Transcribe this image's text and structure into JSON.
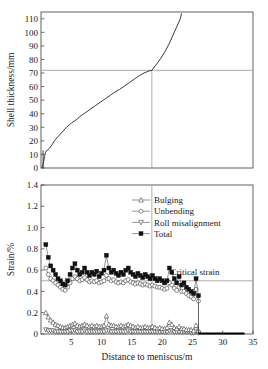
{
  "figure": {
    "top_panel": {
      "ylabel": "Shell thickness/mm",
      "yticks": [
        0,
        10,
        20,
        30,
        40,
        50,
        60,
        70,
        80,
        90,
        100,
        110
      ],
      "ylim": [
        0,
        115
      ],
      "xlim": [
        0,
        35
      ],
      "reference_lines": {
        "horizontal_value": 72,
        "vertical_value": 18.3
      }
    },
    "bottom_panel": {
      "ylabel": "Strain/%",
      "xlabel": "Distance to meniscus/m",
      "yticks": [
        "0",
        "0.2",
        "0.4",
        "0.6",
        "0.8",
        "1.0",
        "1.2",
        "1.4"
      ],
      "ytick_values": [
        0,
        0.2,
        0.4,
        0.6,
        0.8,
        1.0,
        1.2,
        1.4
      ],
      "xticks": [
        5,
        10,
        15,
        20,
        25,
        30,
        35
      ],
      "ylim": [
        0,
        1.4
      ],
      "xlim": [
        0,
        35
      ],
      "annotation": "Critical strain",
      "critical_strain_value": 0.5,
      "vertical_reference_value": 18.3
    },
    "legend": {
      "items": [
        {
          "label": "Bulging",
          "marker": "triangle-up-open"
        },
        {
          "label": "Unbending",
          "marker": "circle-open"
        },
        {
          "label": "Roll misalignment",
          "marker": "triangle-down-open"
        },
        {
          "label": "Total",
          "marker": "square-filled"
        }
      ]
    }
  },
  "chart_data": [
    {
      "type": "line",
      "panel": "top",
      "title": "",
      "xlabel": "Distance to meniscus/m",
      "ylabel": "Shell thickness/mm",
      "xlim": [
        0,
        35
      ],
      "ylim": [
        0,
        115
      ],
      "grid": false,
      "legend_position": "none",
      "annotations": [
        {
          "type": "hline",
          "y": 72
        },
        {
          "type": "vline",
          "x": 18.3
        }
      ],
      "series": [
        {
          "name": "Shell thickness",
          "x": [
            0.15,
            0.3,
            0.45,
            0.6,
            0.75,
            0.9,
            1.1,
            1.4,
            1.8,
            2.3,
            2.9,
            3.5,
            4.2,
            5.0,
            5.8,
            6.6,
            7.4,
            8.2,
            9.0,
            9.8,
            10.6,
            11.4,
            12.2,
            13.0,
            13.8,
            14.6,
            15.4,
            16.2,
            17.0,
            17.8,
            18.3,
            19.0,
            19.8,
            20.5,
            21.2,
            21.8,
            22.3,
            22.7,
            23.0,
            23.2
          ],
          "values": [
            0.5,
            2.0,
            5.0,
            8.5,
            11.5,
            12.8,
            13.2,
            14.5,
            17.0,
            20.5,
            23.5,
            26.5,
            30.0,
            33.0,
            35.5,
            38.5,
            41.0,
            43.5,
            46.0,
            48.5,
            51.0,
            53.5,
            56.0,
            58.0,
            60.5,
            63.0,
            65.5,
            68.0,
            70.0,
            71.5,
            72.0,
            76.0,
            81.0,
            86.0,
            92.0,
            98.0,
            103.0,
            107.0,
            110.0,
            114.0
          ]
        }
      ]
    },
    {
      "type": "scatter",
      "panel": "bottom",
      "title": "",
      "xlabel": "Distance to meniscus/m",
      "ylabel": "Strain/%",
      "xlim": [
        0,
        35
      ],
      "ylim": [
        0,
        1.4
      ],
      "grid": false,
      "legend_position": "upper-center",
      "annotations": [
        {
          "type": "hline",
          "y": 0.5,
          "label": "Critical strain"
        },
        {
          "type": "vline",
          "x": 18.3
        }
      ],
      "x": [
        0.8,
        1.2,
        1.6,
        2.0,
        2.4,
        2.8,
        3.2,
        3.6,
        4.0,
        4.4,
        4.8,
        5.2,
        5.6,
        6.0,
        6.4,
        6.8,
        7.2,
        7.6,
        8.0,
        8.4,
        8.8,
        9.2,
        9.6,
        10.0,
        10.4,
        10.8,
        11.2,
        11.6,
        12.0,
        12.4,
        12.8,
        13.2,
        13.6,
        14.0,
        14.4,
        14.8,
        15.2,
        15.6,
        16.0,
        16.4,
        16.8,
        17.2,
        17.6,
        18.0,
        18.4,
        18.8,
        19.2,
        19.6,
        20.0,
        20.4,
        20.8,
        21.2,
        21.6,
        22.0,
        22.4,
        22.8,
        23.2,
        23.6,
        24.0,
        24.4,
        24.8,
        25.2,
        25.6,
        26.0
      ],
      "series": [
        {
          "name": "Total",
          "marker": "square-filled",
          "values": [
            0.84,
            0.72,
            0.64,
            0.6,
            0.56,
            0.52,
            0.5,
            0.47,
            0.46,
            0.5,
            0.56,
            0.62,
            0.66,
            0.6,
            0.56,
            0.58,
            0.62,
            0.58,
            0.55,
            0.58,
            0.56,
            0.59,
            0.54,
            0.57,
            0.6,
            0.74,
            0.62,
            0.58,
            0.6,
            0.57,
            0.55,
            0.58,
            0.56,
            0.6,
            0.62,
            0.58,
            0.56,
            0.54,
            0.57,
            0.55,
            0.53,
            0.56,
            0.54,
            0.52,
            0.55,
            0.52,
            0.5,
            0.52,
            0.5,
            0.48,
            0.5,
            0.62,
            0.58,
            0.52,
            0.48,
            0.54,
            0.46,
            0.48,
            0.44,
            0.42,
            0.4,
            0.38,
            0.52,
            0.36
          ]
        },
        {
          "name": "Unbending",
          "marker": "circle-open",
          "values": [
            0.62,
            0.56,
            0.52,
            0.5,
            0.48,
            0.46,
            0.44,
            0.42,
            0.41,
            0.44,
            0.48,
            0.52,
            0.54,
            0.52,
            0.5,
            0.51,
            0.53,
            0.51,
            0.49,
            0.5,
            0.49,
            0.5,
            0.48,
            0.49,
            0.5,
            0.55,
            0.52,
            0.5,
            0.51,
            0.49,
            0.48,
            0.49,
            0.48,
            0.5,
            0.51,
            0.49,
            0.48,
            0.47,
            0.48,
            0.47,
            0.46,
            0.47,
            0.46,
            0.45,
            0.46,
            0.45,
            0.44,
            0.44,
            0.43,
            0.42,
            0.43,
            0.48,
            0.46,
            0.43,
            0.41,
            0.44,
            0.4,
            0.4,
            0.38,
            0.36,
            0.35,
            0.33,
            0.42,
            0.31
          ]
        },
        {
          "name": "Bulging",
          "marker": "triangle-up-open",
          "values": [
            0.2,
            0.16,
            0.13,
            0.11,
            0.09,
            0.08,
            0.07,
            0.06,
            0.06,
            0.07,
            0.08,
            0.09,
            0.1,
            0.08,
            0.07,
            0.08,
            0.09,
            0.08,
            0.07,
            0.08,
            0.07,
            0.08,
            0.07,
            0.07,
            0.08,
            0.17,
            0.09,
            0.08,
            0.08,
            0.07,
            0.07,
            0.08,
            0.07,
            0.08,
            0.09,
            0.08,
            0.07,
            0.06,
            0.07,
            0.06,
            0.06,
            0.07,
            0.06,
            0.06,
            0.07,
            0.06,
            0.05,
            0.06,
            0.05,
            0.05,
            0.06,
            0.11,
            0.09,
            0.06,
            0.05,
            0.07,
            0.05,
            0.05,
            0.04,
            0.04,
            0.04,
            0.03,
            0.08,
            0.03
          ]
        },
        {
          "name": "Roll misalignment",
          "marker": "triangle-down-open",
          "values": [
            0.04,
            0.03,
            0.03,
            0.03,
            0.02,
            0.02,
            0.02,
            0.02,
            0.02,
            0.02,
            0.03,
            0.03,
            0.03,
            0.02,
            0.02,
            0.02,
            0.03,
            0.02,
            0.02,
            0.02,
            0.02,
            0.02,
            0.02,
            0.02,
            0.02,
            0.03,
            0.03,
            0.02,
            0.02,
            0.02,
            0.02,
            0.02,
            0.02,
            0.02,
            0.03,
            0.02,
            0.02,
            0.02,
            0.02,
            0.02,
            0.02,
            0.02,
            0.02,
            0.02,
            0.02,
            0.02,
            0.02,
            0.02,
            0.02,
            0.02,
            0.02,
            0.03,
            0.03,
            0.02,
            0.02,
            0.02,
            0.02,
            0.02,
            0.02,
            0.02,
            0.01,
            0.01,
            0.02,
            0.01
          ]
        }
      ]
    }
  ]
}
